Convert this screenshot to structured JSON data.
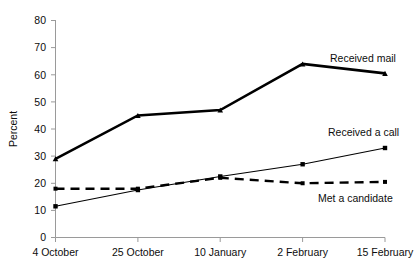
{
  "chart_data": {
    "type": "line",
    "title": "",
    "xlabel": "",
    "ylabel": "Percent",
    "categories": [
      "4 October",
      "25 October",
      "10 January",
      "2 February",
      "15 February"
    ],
    "ylim": [
      0,
      80
    ],
    "yticks": [
      0,
      10,
      20,
      30,
      40,
      50,
      60,
      70,
      80
    ],
    "grid": false,
    "legend_position": "inline-right-annotations",
    "series": [
      {
        "name": "Received mail",
        "values": [
          29,
          45,
          47,
          64,
          60.5
        ],
        "style": "thick-solid",
        "marker": "triangle",
        "color": "#000000"
      },
      {
        "name": "Received a call",
        "values": [
          11.5,
          17.5,
          22.5,
          27,
          33
        ],
        "style": "thin-solid",
        "marker": "square",
        "color": "#000000"
      },
      {
        "name": "Met a candidate",
        "values": [
          18,
          18,
          22,
          20,
          20.5
        ],
        "style": "thick-dashed",
        "marker": "square-small",
        "color": "#000000"
      }
    ],
    "annotations": [
      {
        "text": "Received mail",
        "series": "Received mail"
      },
      {
        "text": "Received a call",
        "series": "Received a call"
      },
      {
        "text": "Met a candidate",
        "series": "Met a candidate"
      }
    ]
  },
  "axis": {
    "y_tick_labels": [
      "0",
      "10",
      "20",
      "30",
      "40",
      "50",
      "60",
      "70",
      "80"
    ],
    "y_title": "Percent",
    "x_tick_labels": [
      "4 October",
      "25 October",
      "10 January",
      "2 February",
      "15 February"
    ]
  },
  "labels": {
    "received_mail": "Received mail",
    "received_a_call": "Received a call",
    "met_a_candidate": "Met a candidate"
  },
  "colors": {
    "series": "#000000",
    "axis": "#9a9a9a",
    "text": "#0d0d0d",
    "background": "#ffffff"
  }
}
